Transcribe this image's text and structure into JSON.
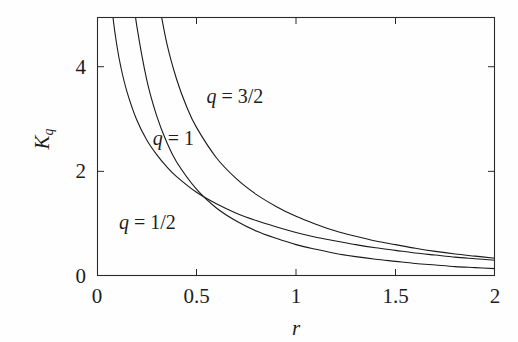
{
  "chart_data": {
    "type": "line",
    "title": "",
    "subtitle": "",
    "xlabel": "r",
    "ylabel": "K_q",
    "ylabel_base": "K",
    "ylabel_sub": "q",
    "xlim": [
      0,
      2
    ],
    "ylim": [
      0,
      4.95
    ],
    "xticks": [
      0,
      0.5,
      1,
      1.5,
      2
    ],
    "xtick_labels": [
      "0",
      "0.5",
      "1",
      "1.5",
      "2"
    ],
    "yticks": [
      0,
      2,
      4
    ],
    "ytick_labels": [
      "0",
      "2",
      "4"
    ],
    "grid": false,
    "legend": "inline-annotations",
    "frame": "box",
    "tick_direction": "in",
    "line_color": "#1a1a1a",
    "line_width": 1.1,
    "background": "#fefefe",
    "annotations": [
      {
        "text": "q = 3/2",
        "var": "q",
        "rest": " = 3/2",
        "x": 0.55,
        "y": 3.42
      },
      {
        "text": "q = 1",
        "var": "q",
        "rest": " = 1",
        "x": 0.28,
        "y": 2.62
      },
      {
        "text": "q = 1/2",
        "var": "q",
        "rest": " = 1/2",
        "x": 0.11,
        "y": 1.02
      }
    ],
    "series": [
      {
        "name": "q = 1/2",
        "q": 0.5,
        "x": [
          0.06,
          0.08,
          0.1,
          0.12,
          0.15,
          0.2,
          0.25,
          0.3,
          0.35,
          0.4,
          0.5,
          0.6,
          0.7,
          0.8,
          0.9,
          1.0,
          1.1,
          1.2,
          1.3,
          1.4,
          1.5,
          1.6,
          1.7,
          1.8,
          1.9,
          2.0
        ],
        "y": [
          5.74,
          4.95,
          4.4,
          3.99,
          3.53,
          2.98,
          2.6,
          2.32,
          2.09,
          1.9,
          1.6,
          1.38,
          1.2,
          1.06,
          0.94,
          0.83,
          0.74,
          0.67,
          0.6,
          0.54,
          0.49,
          0.44,
          0.4,
          0.36,
          0.33,
          0.3
        ]
      },
      {
        "name": "q = 1",
        "q": 1,
        "x": [
          0.17,
          0.2,
          0.25,
          0.3,
          0.35,
          0.4,
          0.5,
          0.6,
          0.7,
          0.8,
          0.9,
          1.0,
          1.1,
          1.2,
          1.3,
          1.4,
          1.5,
          1.6,
          1.7,
          1.8,
          1.9,
          2.0
        ],
        "y": [
          5.66,
          4.78,
          3.75,
          3.06,
          2.56,
          2.18,
          1.66,
          1.3,
          1.05,
          0.86,
          0.72,
          0.6,
          0.51,
          0.43,
          0.37,
          0.32,
          0.28,
          0.24,
          0.21,
          0.18,
          0.16,
          0.14
        ]
      },
      {
        "name": "q = 3/2",
        "q": 1.5,
        "x": [
          0.3,
          0.35,
          0.4,
          0.45,
          0.5,
          0.6,
          0.7,
          0.8,
          0.9,
          1.0,
          1.1,
          1.2,
          1.3,
          1.4,
          1.5,
          1.6,
          1.7,
          1.8,
          1.9,
          2.0
        ],
        "y": [
          5.46,
          4.46,
          3.76,
          3.24,
          2.84,
          2.26,
          1.86,
          1.56,
          1.33,
          1.14,
          0.99,
          0.86,
          0.76,
          0.67,
          0.6,
          0.53,
          0.47,
          0.42,
          0.38,
          0.34
        ]
      }
    ]
  },
  "axes_geometry": {
    "left_px": 97,
    "right_px": 495,
    "top_px": 17,
    "bottom_px": 276
  }
}
